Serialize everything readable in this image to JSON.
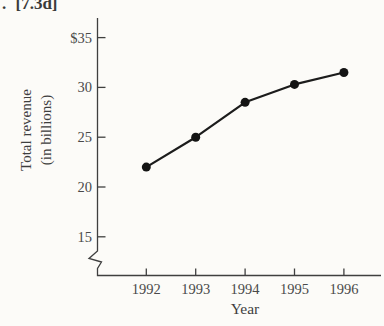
{
  "page": {
    "corner_label": ". [7.3d]",
    "background_color": "#fcfbf8",
    "text_color": "#3e3e3e"
  },
  "chart_data": {
    "type": "line",
    "title": "",
    "x": [
      1992,
      1993,
      1994,
      1995,
      1996
    ],
    "x_tick_labels": [
      "1992",
      "1993",
      "1994",
      "1995",
      "1996"
    ],
    "values": [
      22,
      25,
      28.5,
      30.3,
      31.5
    ],
    "xlabel": "Year",
    "ylabel": "Total revenue (in billions)",
    "ylabel_lines": [
      "Total revenue",
      "(in billions)"
    ],
    "y_ticks": [
      {
        "value": 35,
        "label": "$35"
      },
      {
        "value": 30,
        "label": "30"
      },
      {
        "value": 25,
        "label": "25"
      },
      {
        "value": 20,
        "label": "20"
      },
      {
        "value": 15,
        "label": "15"
      }
    ],
    "ylim": [
      15,
      35
    ],
    "axis_break": true,
    "grid": false,
    "legend": false,
    "line_color": "#1c1c1c",
    "marker_color": "#141414",
    "axis_color": "#3f3f3f"
  }
}
